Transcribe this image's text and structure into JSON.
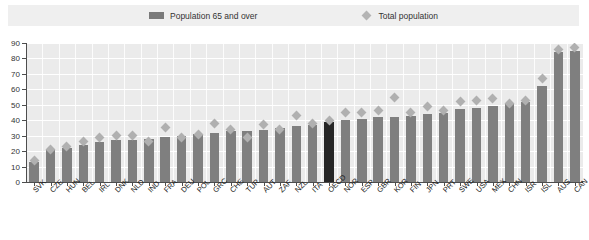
{
  "legend": {
    "items": [
      {
        "label": "Population 65 and over",
        "marker": "bar-swatch-icon",
        "color": "#7a7a7a"
      },
      {
        "label": "Total population",
        "marker": "diamond-marker-icon",
        "color": "#b4b4b4"
      }
    ]
  },
  "axes": {
    "y_ticks": [
      "0",
      "10",
      "20",
      "30",
      "40",
      "50",
      "60",
      "70",
      "80",
      "90"
    ]
  },
  "chart_data": {
    "type": "bar",
    "title": "",
    "subtitle": "",
    "xlabel": "",
    "ylabel": "",
    "ylim": [
      0,
      90
    ],
    "grid": true,
    "legend_position": "top-center",
    "highlight_category": "OECD",
    "highlight_color": "#262626",
    "bar_color": "#7f7f7f",
    "marker_color": "#b0b0b0",
    "categories": [
      "SVK",
      "CZE",
      "HUN",
      "BEL",
      "IRL",
      "DNK",
      "NLD",
      "IND",
      "FRA",
      "DEU",
      "POL",
      "GRC",
      "CHE",
      "TUR",
      "AUT",
      "ZAF",
      "NZL",
      "ITA",
      "OECD",
      "NOR",
      "ESP",
      "GBR",
      "KOR",
      "FIN",
      "JPN",
      "PRT",
      "SWE",
      "USA",
      "MEX",
      "CHN",
      "ISR",
      "ISL",
      "AUS",
      "CAN"
    ],
    "series": [
      {
        "name": "Population 65 and over",
        "type": "bar",
        "values": [
          13,
          21,
          22,
          24,
          26,
          27,
          27,
          28,
          29,
          30,
          31,
          32,
          33,
          33,
          34,
          35,
          36,
          37,
          39,
          40,
          41,
          42,
          42,
          43,
          44,
          45,
          47,
          48,
          49,
          51,
          52,
          62,
          84,
          85
        ]
      },
      {
        "name": "Total population",
        "type": "scatter",
        "values": [
          14,
          21,
          23,
          26,
          29,
          30,
          30,
          26,
          35,
          29,
          31,
          38,
          34,
          29,
          37,
          34,
          43,
          38,
          40,
          45,
          45,
          46,
          55,
          45,
          49,
          46,
          52,
          53,
          54,
          51,
          53,
          67,
          86,
          87
        ]
      }
    ]
  }
}
